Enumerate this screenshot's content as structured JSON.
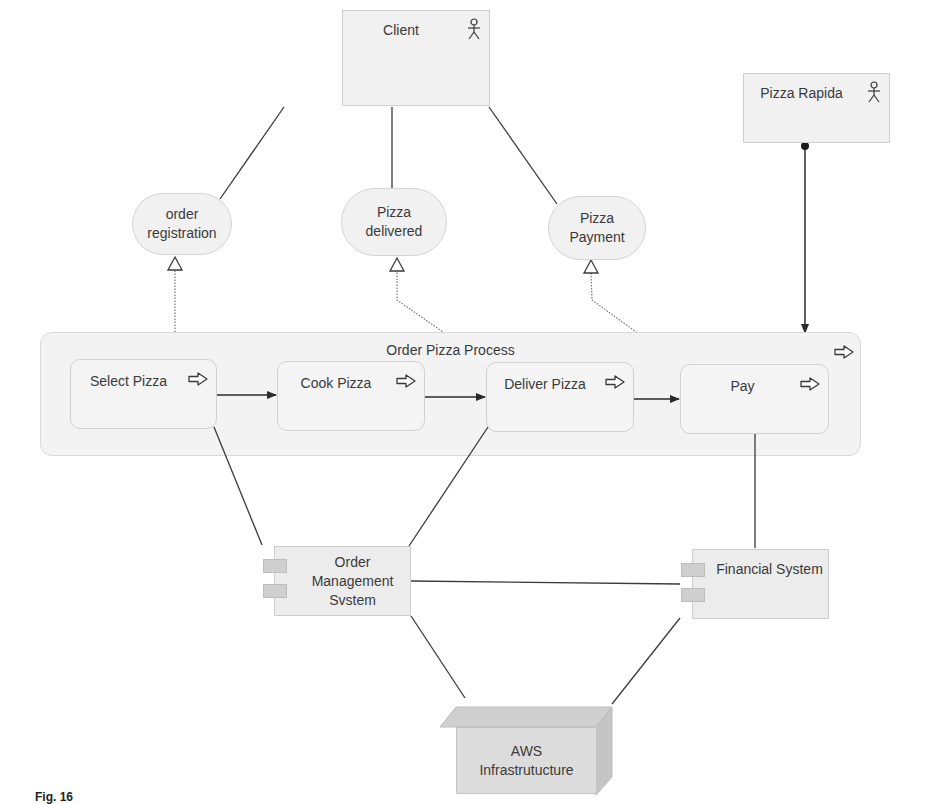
{
  "diagram": {
    "type": "ArchiMate-style business/application/technology layer diagram",
    "actors": [
      {
        "id": "client",
        "label": "Client",
        "icon": "actor-stick-figure-icon"
      },
      {
        "id": "pizza_rapida",
        "label": "Pizza Rapida",
        "icon": "actor-stick-figure-icon"
      }
    ],
    "services": [
      {
        "id": "order_registration",
        "label_line1": "order",
        "label_line2": "registration"
      },
      {
        "id": "pizza_delivered",
        "label_line1": "Pizza",
        "label_line2": "delivered"
      },
      {
        "id": "pizza_payment",
        "label_line1": "Pizza",
        "label_line2": "Payment"
      }
    ],
    "process_group": {
      "label": "Order Pizza Process",
      "icon": "process-arrow-icon",
      "steps": [
        {
          "id": "select_pizza",
          "label": "Select Pizza",
          "icon": "process-arrow-icon"
        },
        {
          "id": "cook_pizza",
          "label": "Cook Pizza",
          "icon": "process-arrow-icon"
        },
        {
          "id": "deliver_pizza",
          "label": "Deliver Pizza",
          "icon": "process-arrow-icon"
        },
        {
          "id": "pay",
          "label": "Pay",
          "icon": "process-arrow-icon"
        }
      ]
    },
    "components": [
      {
        "id": "order_mgmt",
        "label_line1": "Order",
        "label_line2": "Management",
        "label_line3": "Svstem",
        "icon": "component-icon"
      },
      {
        "id": "financial",
        "label": "Financial System",
        "icon": "component-icon"
      }
    ],
    "nodes": [
      {
        "id": "aws",
        "label_line1": "AWS",
        "label_line2": "Infrastrutucture",
        "icon": "node-3d-box"
      }
    ],
    "relationships": [
      {
        "from": "client",
        "to": "order_registration",
        "type": "association"
      },
      {
        "from": "client",
        "to": "pizza_delivered",
        "type": "association"
      },
      {
        "from": "client",
        "to": "pizza_payment",
        "type": "association"
      },
      {
        "from": "pizza_rapida",
        "to": "order_pizza_process",
        "type": "assignment"
      },
      {
        "from": "select_pizza",
        "to": "order_registration",
        "type": "realization"
      },
      {
        "from": "deliver_pizza",
        "to": "pizza_delivered",
        "type": "realization"
      },
      {
        "from": "pay",
        "to": "pizza_payment",
        "type": "realization"
      },
      {
        "from": "select_pizza",
        "to": "cook_pizza",
        "type": "triggering"
      },
      {
        "from": "cook_pizza",
        "to": "deliver_pizza",
        "type": "triggering"
      },
      {
        "from": "deliver_pizza",
        "to": "pay",
        "type": "triggering"
      },
      {
        "from": "select_pizza",
        "to": "order_mgmt",
        "type": "association"
      },
      {
        "from": "deliver_pizza",
        "to": "order_mgmt",
        "type": "association"
      },
      {
        "from": "pay",
        "to": "financial",
        "type": "association"
      },
      {
        "from": "order_mgmt",
        "to": "financial",
        "type": "association"
      },
      {
        "from": "order_mgmt",
        "to": "aws",
        "type": "association"
      },
      {
        "from": "financial",
        "to": "aws",
        "type": "association"
      }
    ]
  },
  "caption": {
    "text": "Fig. 16"
  },
  "colors": {
    "box_fill": "#f1f1f1",
    "box_border": "#cfcfcf",
    "line": "#3a3a3a",
    "realization_line": "#777777",
    "node_front": "#dcdcdc",
    "node_top": "#cfcfcf",
    "node_side": "#c4c4c4",
    "component_tab": "#cfcfcf"
  }
}
